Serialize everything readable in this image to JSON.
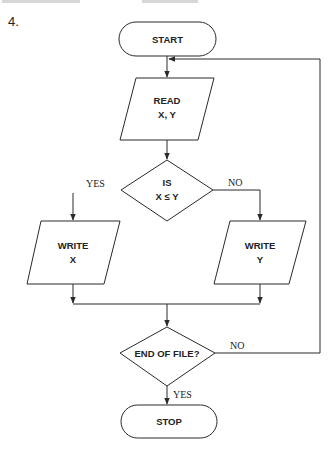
{
  "figure": {
    "number": "4."
  },
  "colors": {
    "stroke": "#2a2a2a",
    "text": "#222222",
    "background": "#ffffff"
  },
  "nodes": {
    "start": {
      "type": "terminator",
      "label": "START"
    },
    "read": {
      "type": "input-output",
      "line1": "READ",
      "line2": "X, Y"
    },
    "compare": {
      "type": "decision",
      "line1": "IS",
      "line2": "X ≤ Y"
    },
    "write_x": {
      "type": "input-output",
      "line1": "WRITE",
      "line2": "X"
    },
    "write_y": {
      "type": "input-output",
      "line1": "WRITE",
      "line2": "Y"
    },
    "eof": {
      "type": "decision",
      "label": "END OF FILE?"
    },
    "stop": {
      "type": "terminator",
      "label": "STOP"
    }
  },
  "branches": {
    "compare_yes": "YES",
    "compare_no": "NO",
    "eof_no": "NO",
    "eof_yes": "YES"
  },
  "edges": [
    {
      "from": "start",
      "to": "read"
    },
    {
      "from": "read",
      "to": "compare"
    },
    {
      "from": "compare",
      "to": "write_x",
      "label": "YES"
    },
    {
      "from": "compare",
      "to": "write_y",
      "label": "NO"
    },
    {
      "from": "write_x",
      "to": "eof"
    },
    {
      "from": "write_y",
      "to": "eof"
    },
    {
      "from": "eof",
      "to": "read",
      "label": "NO"
    },
    {
      "from": "eof",
      "to": "stop",
      "label": "YES"
    }
  ]
}
